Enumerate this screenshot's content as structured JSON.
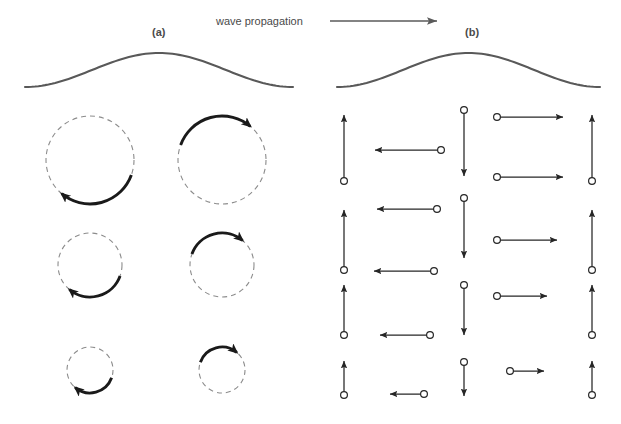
{
  "figure": {
    "header": {
      "caption": "wave propagation",
      "arrow_icon": "right-arrow-icon",
      "arrow_x1": 330,
      "arrow_x2": 437,
      "arrow_y": 21,
      "caption_x": 216,
      "caption_y": 25
    },
    "colors": {
      "text": "#4a4a4a",
      "wave_stroke": "#595959",
      "orbit_dash": "#8c8c8c",
      "arc_arrow": "#1a1a1a",
      "vector": "#262626",
      "background": "#ffffff"
    },
    "panels": [
      {
        "id": "a",
        "label": "(a)",
        "label_x": 152,
        "label_y": 36,
        "type": "orbital-circles",
        "wave": {
          "x0": 25,
          "x1": 293,
          "y_mid": 70,
          "amplitude": 17,
          "phase": "trough-left-crest-right"
        },
        "orbit_rows": [
          {
            "row": 1,
            "cy": 160,
            "radius": 44,
            "orbits": [
              {
                "col": 1,
                "cx": 90,
                "arrow_position": "bottom",
                "rotation": "clockwise",
                "arc_start_deg": 20,
                "arc_end_deg": 130
              },
              {
                "col": 2,
                "cx": 222,
                "arrow_position": "top",
                "rotation": "clockwise",
                "arc_start_deg": 200,
                "arc_end_deg": 310
              }
            ]
          },
          {
            "row": 2,
            "cy": 265,
            "radius": 32,
            "orbits": [
              {
                "col": 1,
                "cx": 90,
                "arrow_position": "bottom",
                "rotation": "clockwise",
                "arc_start_deg": 20,
                "arc_end_deg": 130
              },
              {
                "col": 2,
                "cx": 222,
                "arrow_position": "top",
                "rotation": "clockwise",
                "arc_start_deg": 200,
                "arc_end_deg": 310
              }
            ]
          },
          {
            "row": 3,
            "cy": 370,
            "radius": 23,
            "orbits": [
              {
                "col": 1,
                "cx": 90,
                "arrow_position": "bottom",
                "rotation": "clockwise",
                "arc_start_deg": 20,
                "arc_end_deg": 130
              },
              {
                "col": 2,
                "cx": 222,
                "arrow_position": "top",
                "rotation": "clockwise",
                "arc_start_deg": 200,
                "arc_end_deg": 310
              }
            ]
          }
        ]
      },
      {
        "id": "b",
        "label": "(b)",
        "label_x": 465,
        "label_y": 36,
        "type": "velocity-vectors",
        "wave": {
          "x0": 337,
          "x1": 600,
          "y_mid": 70,
          "amplitude": 17,
          "phase": "trough-left-crest-right"
        },
        "vector_rows": [
          {
            "row": 1,
            "length": 66,
            "vectors": [
              {
                "col": 1,
                "direction": "up",
                "tail_x": 344,
                "tail_y": 181
              },
              {
                "col": 2,
                "direction": "left",
                "tail_x": 441,
                "tail_y": 150
              },
              {
                "col": 3,
                "direction": "down",
                "tail_x": 464,
                "tail_y": 110
              },
              {
                "col": 4,
                "direction": "right",
                "tail_x": 497,
                "tail_y": 117
              },
              {
                "col": 5,
                "direction": "right",
                "tail_x": 497,
                "tail_y": 177
              },
              {
                "col": 6,
                "direction": "up",
                "tail_x": 592,
                "tail_y": 181
              }
            ]
          },
          {
            "row": 2,
            "length": 60,
            "vectors": [
              {
                "col": 1,
                "direction": "up",
                "tail_x": 344,
                "tail_y": 270
              },
              {
                "col": 2,
                "direction": "left",
                "tail_x": 437,
                "tail_y": 209
              },
              {
                "col": 3,
                "direction": "down",
                "tail_x": 464,
                "tail_y": 198
              },
              {
                "col": 4,
                "direction": "right",
                "tail_x": 497,
                "tail_y": 240
              },
              {
                "col": 5,
                "direction": "left",
                "tail_x": 434,
                "tail_y": 271
              },
              {
                "col": 6,
                "direction": "up",
                "tail_x": 592,
                "tail_y": 270
              }
            ]
          },
          {
            "row": 3,
            "length": 50,
            "vectors": [
              {
                "col": 1,
                "direction": "up",
                "tail_x": 344,
                "tail_y": 335
              },
              {
                "col": 2,
                "direction": "left",
                "tail_x": 430,
                "tail_y": 335
              },
              {
                "col": 3,
                "direction": "down",
                "tail_x": 464,
                "tail_y": 285
              },
              {
                "col": 4,
                "direction": "right",
                "tail_x": 497,
                "tail_y": 296
              },
              {
                "col": 6,
                "direction": "up",
                "tail_x": 592,
                "tail_y": 335
              }
            ]
          },
          {
            "row": 4,
            "length": 34,
            "vectors": [
              {
                "col": 1,
                "direction": "up",
                "tail_x": 344,
                "tail_y": 395
              },
              {
                "col": 2,
                "direction": "left",
                "tail_x": 424,
                "tail_y": 394
              },
              {
                "col": 3,
                "direction": "down",
                "tail_x": 464,
                "tail_y": 362
              },
              {
                "col": 4,
                "direction": "right",
                "tail_x": 510,
                "tail_y": 371
              },
              {
                "col": 6,
                "direction": "up",
                "tail_x": 592,
                "tail_y": 395
              }
            ]
          }
        ]
      }
    ]
  }
}
